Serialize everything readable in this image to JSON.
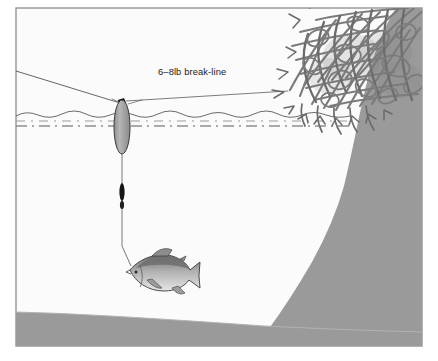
{
  "figure": {
    "type": "fishing-technique-diagram",
    "frame": {
      "border_color": "#8c8c8c",
      "background_color": "#fbfbfb",
      "outer_margin_color": "#ffffff"
    }
  },
  "annotations": {
    "break_line_label": "6–8lb break-line"
  },
  "scene": {
    "water": {
      "label": "water-body",
      "fill_color": "#fbfbfb",
      "surface_line_color": "#4d4d4d",
      "sub_surface_dash_color": "#8a8a8a",
      "surface_y": 112,
      "dash_y": 126
    },
    "shoreline": {
      "label": "sloping-bank",
      "fill_color": "#9a9a9a"
    },
    "lake_bottom": {
      "label": "lake-bottom",
      "fill_color": "#9a9a9a"
    },
    "brush": {
      "label": "flooded-brush-pile",
      "branch_color": "#7b7b7b",
      "branch_color_dark": "#5f5f5f"
    },
    "rig": {
      "main_line_color": "#4a4a4a",
      "float": {
        "label": "slip-float",
        "fill_color": "#a8a8a8",
        "stroke_color": "#3a3a3a",
        "center_x": 122,
        "center_y": 127,
        "radius_x": 8,
        "radius_y": 27
      },
      "knot": {
        "label": "line-knot",
        "color": "#111111"
      },
      "sinker": {
        "label": "split-shot-sinker",
        "color": "#151515"
      },
      "fish": {
        "label": "hooked-fish",
        "body_color": "#b4b4b4",
        "back_color": "#6e6e6e",
        "outline_color": "#3a3a3a"
      }
    }
  }
}
